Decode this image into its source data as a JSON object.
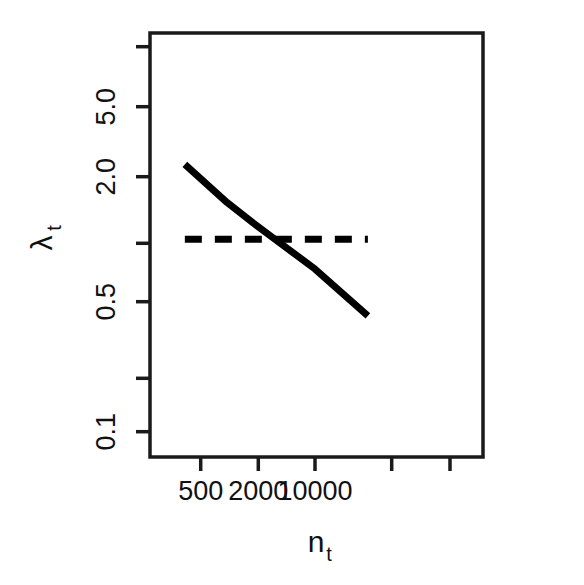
{
  "chart_data": {
    "type": "line",
    "title": "",
    "xlabel": "n_t",
    "xlabel_main": "n",
    "xlabel_sub": "t",
    "ylabel": "λ_t",
    "ylabel_main": "λ",
    "ylabel_sub": "t",
    "xscale": "log",
    "yscale": "log",
    "xlim": [
      300,
      40000
    ],
    "ylim": [
      0.1,
      10
    ],
    "grid": false,
    "legend": "none",
    "x_ticks": [
      500,
      2000,
      10000,
      40000,
      150000
    ],
    "x_tick_labels": [
      "500",
      "2000",
      "10000",
      "",
      ""
    ],
    "y_ticks": [
      10.0,
      5.0,
      2.0,
      1.0,
      0.5,
      0.2,
      0.1
    ],
    "y_tick_labels": [
      "",
      "5.0",
      "2.0",
      "",
      "0.5",
      "",
      "0.1"
    ],
    "series": [
      {
        "name": "fitted-decline",
        "style": "solid",
        "color": "#000000",
        "width": 7,
        "x": [
          330,
          40000
        ],
        "y": [
          2.45,
          0.4
        ],
        "points": [
          {
            "x": 330,
            "y": 2.45
          },
          {
            "x": 1000,
            "y": 1.55
          },
          {
            "x": 2000,
            "y": 1.21
          },
          {
            "x": 3500,
            "y": 1.0
          },
          {
            "x": 10000,
            "y": 0.7
          },
          {
            "x": 40000,
            "y": 0.4
          }
        ]
      },
      {
        "name": "replacement-threshold",
        "style": "dashed",
        "color": "#000000",
        "width": 7,
        "x": [
          330,
          40000
        ],
        "y": [
          1.0,
          1.0
        ],
        "constant": 1.0
      }
    ],
    "annotations": [
      {
        "text": "crossing point where solid line meets threshold",
        "x": 3500,
        "y": 1.0
      }
    ]
  },
  "axis": {
    "x_tick_labels": [
      "500",
      "2000",
      "10000"
    ],
    "y_tick_labels": [
      "5.0",
      "2.0",
      "0.5",
      "0.1"
    ],
    "x_title_main": "n",
    "x_title_sub": "t",
    "y_title_main": "λ",
    "y_title_sub": "t"
  },
  "style": {
    "line_color": "#000000",
    "axis_color": "#1a1a1a",
    "background": "#ffffff"
  }
}
